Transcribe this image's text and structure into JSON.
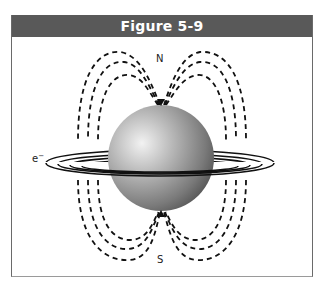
{
  "figure": {
    "title": "Figure 5-9",
    "labels": {
      "north": "N",
      "south": "S",
      "electron": "e",
      "electron_charge": "−"
    },
    "colors": {
      "header_bg": "#595959",
      "header_text": "#ffffff",
      "sphere_light": "#e6e6e6",
      "sphere_dark": "#5a5a5a",
      "field_lines": "#111111"
    }
  }
}
